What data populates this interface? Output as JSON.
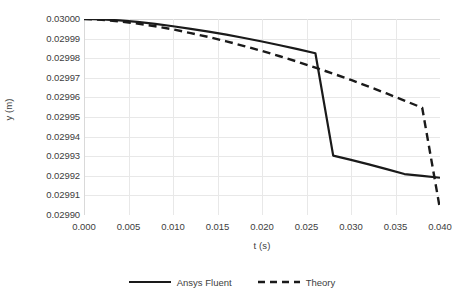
{
  "chart_data": {
    "type": "line",
    "title": "",
    "xlabel": "t (s)",
    "ylabel": "y (m)",
    "xlim": [
      0.0,
      0.04
    ],
    "ylim": [
      0.0299,
      0.03
    ],
    "xticks": [
      "0.000",
      "0.005",
      "0.010",
      "0.015",
      "0.020",
      "0.025",
      "0.030",
      "0.035",
      "0.040"
    ],
    "xtick_values": [
      0.0,
      0.005,
      0.01,
      0.015,
      0.02,
      0.025,
      0.03,
      0.035,
      0.04
    ],
    "yticks": [
      "0.02990",
      "0.02991",
      "0.02992",
      "0.02993",
      "0.02994",
      "0.02995",
      "0.02996",
      "0.02997",
      "0.02998",
      "0.02999",
      "0.03000"
    ],
    "ytick_values": [
      0.0299,
      0.02991,
      0.02992,
      0.02993,
      0.02994,
      0.02995,
      0.02996,
      0.02997,
      0.02998,
      0.02999,
      0.03
    ],
    "grid": true,
    "grid_color": "#e8e8e8",
    "axis_color": "#d9d9d9",
    "legend_position": "bottom",
    "x": [
      0.0,
      0.002,
      0.004,
      0.006,
      0.008,
      0.01,
      0.012,
      0.014,
      0.016,
      0.018,
      0.02,
      0.022,
      0.024,
      0.026,
      0.028,
      0.03,
      0.032,
      0.034,
      0.036,
      0.038,
      0.04
    ],
    "series": [
      {
        "name": "Ansys Fluent",
        "color": "#1a1a1a",
        "style": "solid",
        "values": [
          0.03,
          0.0299998,
          0.0299993,
          0.0299985,
          0.0299975,
          0.0299963,
          0.029995,
          0.0299936,
          0.029992,
          0.0299903,
          0.0299885,
          0.0299866,
          0.0299846,
          0.0299825,
          0.0299303,
          0.0299281,
          0.0299258,
          0.0299234,
          0.0299209,
          0.02992,
          0.029919
        ]
      },
      {
        "name": "Theory",
        "color": "#1a1a1a",
        "style": "dashed",
        "values": [
          0.03,
          0.0299996,
          0.0299988,
          0.0299977,
          0.0299963,
          0.0299947,
          0.0299928,
          0.0299908,
          0.0299886,
          0.0299862,
          0.0299837,
          0.029981,
          0.0299782,
          0.0299752,
          0.0299721,
          0.0299689,
          0.0299655,
          0.029962,
          0.0299584,
          0.0299547,
          0.029903
        ]
      }
    ]
  },
  "legend": {
    "items": [
      {
        "label": "Ansys Fluent",
        "style": "solid"
      },
      {
        "label": "Theory",
        "style": "dashed"
      }
    ]
  }
}
